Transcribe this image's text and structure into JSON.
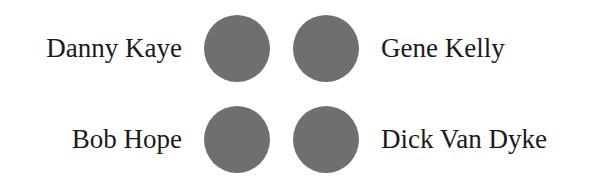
{
  "diagram": {
    "dot_color": "#6f6f6f",
    "rows": [
      {
        "left_label": "Danny Kaye",
        "right_label": "Gene Kelly"
      },
      {
        "left_label": "Bob Hope",
        "right_label": "Dick Van Dyke"
      }
    ]
  }
}
